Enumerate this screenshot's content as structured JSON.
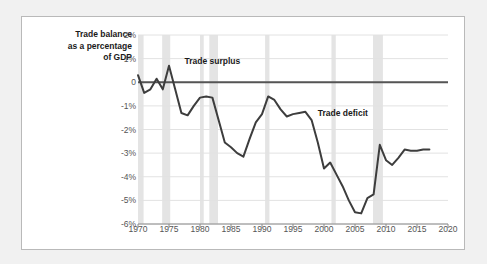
{
  "chart_data": {
    "type": "line",
    "title": "Trade balance as a percentage of GDP",
    "title_lines": "Trade balance\nas a percentage\nof GDP",
    "xlabel": "",
    "ylabel": "Trade balance as a percentage of GDP",
    "xlim": [
      1970,
      2020
    ],
    "ylim": [
      -6,
      2
    ],
    "grid": true,
    "legend_position": "none",
    "line_color": "#3d3d3d",
    "zero_line_color": "#555555",
    "grid_color": "#e2e2e2",
    "recession_band_color": "#e4e4e4",
    "ytick_labels": [
      "2%",
      "1%",
      "0",
      "-1%",
      "-2%",
      "-3%",
      "-4%",
      "-5%",
      "-6%"
    ],
    "ytick_values": [
      2,
      1,
      0,
      -1,
      -2,
      -3,
      -4,
      -5,
      -6
    ],
    "xtick_labels": [
      "1970",
      "1975",
      "1980",
      "1985",
      "1990",
      "1995",
      "2000",
      "2005",
      "2010",
      "2015",
      "2020"
    ],
    "xtick_values": [
      1970,
      1975,
      1980,
      1985,
      1990,
      1995,
      2000,
      2005,
      2010,
      2015,
      2020
    ],
    "annotations": [
      {
        "text": "Trade surplus",
        "x": 1977.5,
        "y": 0.85
      },
      {
        "text": "Trade deficit",
        "x": 1999.0,
        "y": -1.35
      }
    ],
    "recessions": [
      {
        "start": 1970.0,
        "end": 1970.9
      },
      {
        "start": 1973.9,
        "end": 1975.2
      },
      {
        "start": 1980.0,
        "end": 1980.6
      },
      {
        "start": 1981.5,
        "end": 1982.9
      },
      {
        "start": 1990.5,
        "end": 1991.2
      },
      {
        "start": 2001.2,
        "end": 2001.9
      },
      {
        "start": 2007.9,
        "end": 2009.5
      }
    ],
    "x": [
      1970,
      1971,
      1972,
      1973,
      1974,
      1975,
      1976,
      1977,
      1978,
      1979,
      1980,
      1981,
      1982,
      1983,
      1984,
      1985,
      1986,
      1987,
      1988,
      1989,
      1990,
      1991,
      1992,
      1993,
      1994,
      1995,
      1996,
      1997,
      1998,
      1999,
      2000,
      2001,
      2002,
      2003,
      2004,
      2005,
      2006,
      2007,
      2008,
      2009,
      2010,
      2011,
      2012,
      2013,
      2014,
      2015,
      2016,
      2017
    ],
    "values": [
      0.3,
      -0.45,
      -0.3,
      0.15,
      -0.3,
      0.7,
      -0.3,
      -1.3,
      -1.4,
      -1.0,
      -0.65,
      -0.6,
      -0.65,
      -1.6,
      -2.55,
      -2.75,
      -3.0,
      -3.15,
      -2.4,
      -1.7,
      -1.35,
      -0.6,
      -0.75,
      -1.15,
      -1.45,
      -1.35,
      -1.3,
      -1.25,
      -1.6,
      -2.55,
      -3.65,
      -3.4,
      -3.9,
      -4.4,
      -5.0,
      -5.5,
      -5.55,
      -4.9,
      -4.75,
      -2.65,
      -3.3,
      -3.5,
      -3.2,
      -2.85,
      -2.9,
      -2.9,
      -2.85,
      -2.85
    ],
    "series": [
      {
        "name": "Trade balance as a percentage of GDP",
        "values": [
          0.3,
          -0.45,
          -0.3,
          0.15,
          -0.3,
          0.7,
          -0.3,
          -1.3,
          -1.4,
          -1.0,
          -0.65,
          -0.6,
          -0.65,
          -1.6,
          -2.55,
          -2.75,
          -3.0,
          -3.15,
          -2.4,
          -1.7,
          -1.35,
          -0.6,
          -0.75,
          -1.15,
          -1.45,
          -1.35,
          -1.3,
          -1.25,
          -1.6,
          -2.55,
          -3.65,
          -3.4,
          -3.9,
          -4.4,
          -5.0,
          -5.5,
          -5.55,
          -4.9,
          -4.75,
          -2.65,
          -3.3,
          -3.5,
          -3.2,
          -2.85,
          -2.9,
          -2.9,
          -2.85,
          -2.85
        ]
      }
    ]
  }
}
